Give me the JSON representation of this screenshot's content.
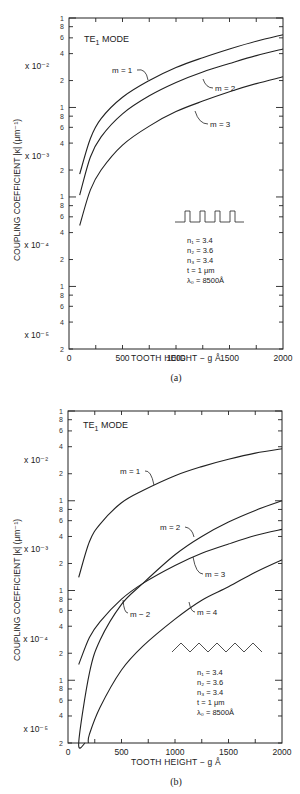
{
  "chart_data": [
    {
      "type": "line",
      "panel": "(a)",
      "title": "TE1 MODE",
      "xlabel": "TOOTH HEIGHT − g Å",
      "ylabel": "COUPLING COEFFICIENT |κ| (μm⁻¹)",
      "xlim": [
        0,
        2000
      ],
      "ylim": [
        2e-05,
        0.1
      ],
      "yscale": "log",
      "x_ticks": [
        0,
        500,
        1000,
        1500,
        2000
      ],
      "y_decade_labels": [
        "x 10⁻²",
        "x 10⁻³",
        "x 10⁻⁴",
        "x 10⁻⁵"
      ],
      "y_minor_labels": [
        "1",
        "8",
        "6",
        "4",
        "2"
      ],
      "grating_shape": "rectangular",
      "parameters": [
        "n1 = 3.4",
        "n2 = 3.6",
        "n3 = 3.4",
        "t = 1 μm",
        "λ0 = 8500Å"
      ],
      "x": [
        100,
        200,
        300,
        500,
        750,
        1000,
        1250,
        1500,
        1750,
        2000
      ],
      "series": [
        {
          "name": "m = 1",
          "values": [
            0.0018,
            0.0045,
            0.0075,
            0.013,
            0.02,
            0.028,
            0.036,
            0.045,
            0.055,
            0.065
          ]
        },
        {
          "name": "m = 2",
          "values": [
            0.00105,
            0.0028,
            0.0047,
            0.0085,
            0.0135,
            0.019,
            0.025,
            0.031,
            0.038,
            0.045
          ]
        },
        {
          "name": "m = 3",
          "values": [
            0.00048,
            0.0012,
            0.002,
            0.0038,
            0.0062,
            0.009,
            0.0118,
            0.015,
            0.0185,
            0.022
          ]
        }
      ],
      "grid": false,
      "legend": "inline labels"
    },
    {
      "type": "line",
      "panel": "(b)",
      "title": "TE1 MODE",
      "xlabel": "TOOTH HEIGHT − g Å",
      "ylabel": "COUPLING COEFFICIENT |κ| (μm⁻¹)",
      "xlim": [
        0,
        2000
      ],
      "ylim": [
        2e-05,
        0.1
      ],
      "yscale": "log",
      "x_ticks": [
        0,
        500,
        1000,
        1500,
        2000
      ],
      "y_decade_labels": [
        "x 10⁻²",
        "x 10⁻³",
        "x 10⁻⁴",
        "x 10⁻⁵"
      ],
      "grating_shape": "triangular (sawtooth)",
      "parameters": [
        "n1 = 3.4",
        "n2 = 3.6",
        "n3 = 3.4",
        "t = 1 μm",
        "λ0 = 8500Å"
      ],
      "x": [
        100,
        200,
        300,
        500,
        700,
        1000,
        1250,
        1500,
        1750,
        2000
      ],
      "series": [
        {
          "name": "m = 1",
          "values": [
            0.0014,
            0.0035,
            0.0055,
            0.0095,
            0.013,
            0.019,
            0.024,
            0.029,
            0.034,
            0.038
          ]
        },
        {
          "name": "m = 2",
          "values": [
            2e-05,
            0.00012,
            0.00028,
            0.0007,
            0.0012,
            0.0025,
            0.004,
            0.0058,
            0.0078,
            0.01
          ]
        },
        {
          "name": "m = 3",
          "values": [
            0.00015,
            0.0003,
            0.00045,
            0.0008,
            0.0012,
            0.0019,
            0.0026,
            0.0033,
            0.0041,
            0.0048
          ]
        },
        {
          "name": "m = 4",
          "values": [
            null,
            2.5e-05,
            5e-05,
            0.00013,
            0.00024,
            0.00048,
            0.00078,
            0.0011,
            0.0016,
            0.0022
          ]
        }
      ],
      "annotations": [
        "m - 2 (second label near crossover)"
      ],
      "grid": false,
      "legend": "inline labels"
    }
  ],
  "panels": [
    {
      "title_main": "TE",
      "title_sub": "1",
      "title_rest": " MODE",
      "caption": "(a)",
      "xlabel": "TOOTH HEIGHT − g Å",
      "ylabel": "COUPLING COEFFICIENT |κ| (μm⁻¹)",
      "x_ticks": [
        "0",
        "500",
        "1000",
        "1500",
        "2000"
      ],
      "exp_labels": [
        "x 10⁻²",
        "x 10⁻³",
        "x 10⁻⁴",
        "x 10⁻⁵"
      ],
      "labels": {
        "m1": "m = 1",
        "m2": "m = 2",
        "m3": "m = 3"
      },
      "params": [
        "n₁ = 3.4",
        "n₂ = 3.6",
        "n₃ = 3.4",
        "t = 1 μm",
        "λ₀ = 8500Å"
      ]
    },
    {
      "title_main": "TE",
      "title_sub": "1",
      "title_rest": " MODE",
      "caption": "(b)",
      "xlabel": "TOOTH HEIGHT − g Å",
      "ylabel": "COUPLING COEFFICIENT |κ| (μm⁻¹)",
      "x_ticks": [
        "0",
        "500",
        "1000",
        "1500",
        "2000"
      ],
      "exp_labels": [
        "x 10⁻²",
        "x 10⁻³",
        "x 10⁻⁴",
        "x 10⁻⁵"
      ],
      "labels": {
        "m1": "m = 1",
        "m2": "m = 2",
        "m2b": "m − 2",
        "m3": "m = 3",
        "m4": "m = 4"
      },
      "params": [
        "n₁ = 3.4",
        "n₂ = 3.6",
        "n₃ = 3.4",
        "t = 1 μm",
        "λ₀ = 8500Å"
      ]
    }
  ],
  "minor_tick_labels": [
    "1",
    "8",
    "6",
    "4",
    "2"
  ],
  "top_label": "1",
  "bottom_label": "2"
}
